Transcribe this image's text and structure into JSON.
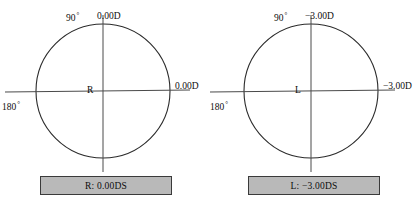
{
  "figure": {
    "type": "optical-cross-diagram-pair",
    "background_color": "#ffffff",
    "line_color": "#2b2b2b",
    "box_fill_color": "#b9b9b9",
    "box_border_color": "#3a3a3a"
  },
  "diagrams": [
    {
      "eye": "R",
      "center_label": "R",
      "axis_vertical_label": "90",
      "axis_vertical_degree": "°",
      "axis_horizontal_label": "180",
      "axis_horizontal_degree": "°",
      "power_vertical_meridian": "0.00D",
      "power_horizontal_meridian": "0.00D",
      "result": "R: 0.00DS"
    },
    {
      "eye": "L",
      "center_label": "L",
      "axis_vertical_label": "90",
      "axis_vertical_degree": "°",
      "axis_horizontal_label": "180",
      "axis_horizontal_degree": "°",
      "power_vertical_meridian": "−3.00D",
      "power_horizontal_meridian": "−3.00D",
      "result": "L: −3.00DS"
    }
  ]
}
